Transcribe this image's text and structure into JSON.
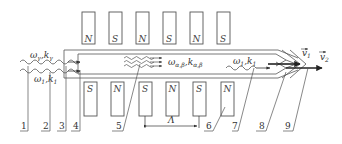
{
  "diagram": {
    "type": "undulator-schematic",
    "colors": {
      "stroke": "#555555",
      "text": "#333333",
      "background": "#ffffff",
      "arrow": "#333333"
    },
    "top_magnets": [
      {
        "pole": "N",
        "x": 82
      },
      {
        "pole": "S",
        "x": 109
      },
      {
        "pole": "N",
        "x": 136
      },
      {
        "pole": "S",
        "x": 163
      },
      {
        "pole": "N",
        "x": 190
      },
      {
        "pole": "S",
        "x": 217
      }
    ],
    "bottom_magnets": [
      {
        "pole": "S",
        "x": 84
      },
      {
        "pole": "N",
        "x": 111
      },
      {
        "pole": "S",
        "x": 139
      },
      {
        "pole": "N",
        "x": 166
      },
      {
        "pole": "S",
        "x": 193
      },
      {
        "pole": "N",
        "x": 221
      }
    ],
    "wave_labels": {
      "gamma": {
        "omega": "ω",
        "omega_sub": "γ",
        "k": "k",
        "k_sub": "γ",
        "sep": ","
      },
      "one_in": {
        "omega": "ω",
        "omega_sub": "1",
        "k": "k",
        "k_sub": "1",
        "sep": ","
      },
      "alpha_beta": {
        "omega": "ω",
        "omega_sub": "α,β",
        "k": "k",
        "k_sub": "α,β",
        "sep": ","
      },
      "one_out": {
        "omega": "ω",
        "omega_sub": "1",
        "k": "k",
        "k_sub": "1",
        "sep": ","
      }
    },
    "velocity_labels": {
      "v1": {
        "symbol": "v",
        "sub": "1",
        "vector": "→"
      },
      "v2": {
        "symbol": "v",
        "sub": "2",
        "vector": "→"
      }
    },
    "period_label": "Λ",
    "callout_numbers": [
      "1",
      "2",
      "3",
      "4",
      "5",
      "6",
      "7",
      "8",
      "9"
    ]
  }
}
